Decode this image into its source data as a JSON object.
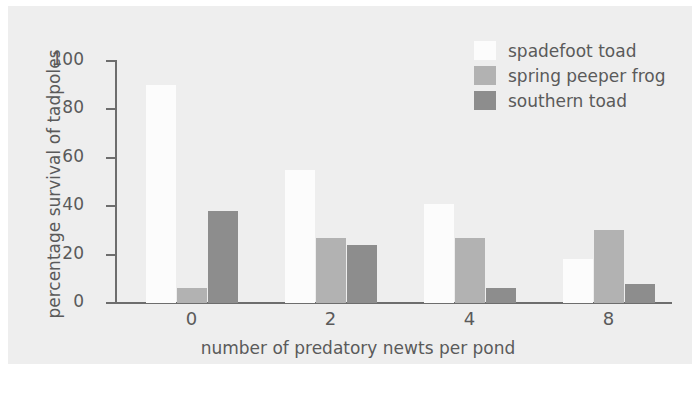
{
  "chart_data": {
    "type": "bar",
    "title": "",
    "xlabel": "number of predatory newts per pond",
    "ylabel": "percentage survival of tadpoles",
    "categories": [
      "0",
      "2",
      "4",
      "8"
    ],
    "series": [
      {
        "name": "spadefoot toad",
        "color": "#fcfcfc",
        "values": [
          90,
          55,
          41,
          18
        ]
      },
      {
        "name": "spring peeper frog",
        "color": "#b2b2b2",
        "values": [
          6,
          27,
          27,
          30
        ]
      },
      {
        "name": "southern toad",
        "color": "#8d8d8d",
        "values": [
          38,
          24,
          6,
          8
        ]
      }
    ],
    "ylim": [
      0,
      100
    ],
    "yticks": [
      "0",
      "20",
      "40",
      "60",
      "80",
      "100"
    ],
    "grid": false,
    "legend_position": "top-right",
    "plot_background": "#eeeeee",
    "axis_color": "#6d6d6d",
    "text_color": "#5a5a5a"
  }
}
